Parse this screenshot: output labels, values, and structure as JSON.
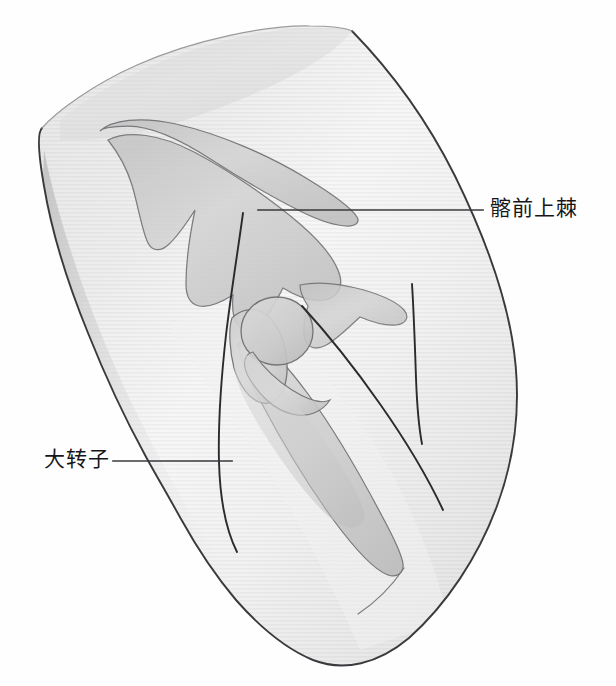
{
  "figure": {
    "type": "anatomical-illustration",
    "region": "hip",
    "view": "anterolateral-oblique",
    "background_color": "#fefefe"
  },
  "labels": [
    {
      "id": "asis",
      "text": "髂前上棘",
      "text_x": 490,
      "text_y": 198,
      "leader_from_x": 258,
      "leader_from_y": 210,
      "leader_to_x": 483,
      "leader_to_y": 210,
      "color": "#16161a"
    },
    {
      "id": "greater-trochanter",
      "text": "大转子",
      "text_x": 44,
      "text_y": 449,
      "leader_from_x": 232,
      "leader_from_y": 461,
      "leader_to_x": 113,
      "leader_to_y": 461,
      "color": "#16161a"
    }
  ],
  "colors": {
    "body_fill_light": "#e6e6e6",
    "body_fill_mid": "#d2d2d2",
    "body_fill_dark": "#bcbcbc",
    "bone_fill": "#cfcfcf",
    "bone_stroke": "#6e6e72",
    "outline_stroke": "#3a3a3e",
    "crease_stroke": "#2b2b2f",
    "label_text": "#16161a",
    "leader_line": "#3a3a3e"
  },
  "structures": [
    {
      "name": "thigh-silhouette",
      "label": "大腿及髋部体表轮廓"
    },
    {
      "name": "ilium",
      "label": "髂骨"
    },
    {
      "name": "iliac-crest",
      "label": "髂嵴"
    },
    {
      "name": "anterior-superior-iliac-spine",
      "label": "髂前上棘"
    },
    {
      "name": "acetabulum-pubis",
      "label": "耻骨支与髋臼区"
    },
    {
      "name": "femoral-head",
      "label": "股骨头"
    },
    {
      "name": "femoral-neck",
      "label": "股骨颈"
    },
    {
      "name": "greater-trochanter",
      "label": "大转子"
    },
    {
      "name": "femoral-shaft",
      "label": "股骨干"
    },
    {
      "name": "inguinal-crease",
      "label": "腹股沟皱襞"
    },
    {
      "name": "lateral-thigh-crease",
      "label": "大腿外侧轮廓线"
    }
  ]
}
